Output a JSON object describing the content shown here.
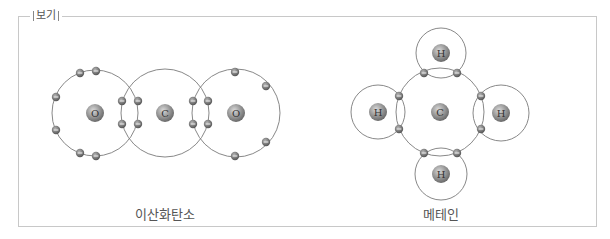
{
  "box": {
    "legend_label": "보기"
  },
  "molecules": [
    {
      "name": "이산화탄소",
      "atoms": [
        {
          "symbol": "O",
          "cx": 95,
          "cy": 113,
          "shell_r": 43
        },
        {
          "symbol": "C",
          "cx": 165,
          "cy": 113,
          "shell_r": 44
        },
        {
          "symbol": "O",
          "cx": 236,
          "cy": 113,
          "shell_r": 44
        }
      ],
      "electrons": [
        [
          80,
          73
        ],
        [
          56,
          97
        ],
        [
          56,
          130
        ],
        [
          80,
          153
        ],
        [
          96,
          156
        ],
        [
          122,
          101
        ],
        [
          122,
          124
        ],
        [
          138,
          101
        ],
        [
          138,
          124
        ],
        [
          193,
          101
        ],
        [
          193,
          124
        ],
        [
          208,
          101
        ],
        [
          208,
          124
        ],
        [
          235,
          72
        ],
        [
          266,
          86
        ],
        [
          266,
          142
        ],
        [
          235,
          156
        ],
        [
          96,
          71
        ]
      ],
      "caption_pos": [
        165,
        213
      ]
    },
    {
      "name": "메테인",
      "atoms": [
        {
          "symbol": "C",
          "cx": 440,
          "cy": 112,
          "shell_r": 44
        },
        {
          "symbol": "H",
          "cx": 441,
          "cy": 53,
          "shell_r": 25
        },
        {
          "symbol": "H",
          "cx": 378,
          "cy": 112,
          "shell_r": 27
        },
        {
          "symbol": "H",
          "cx": 501,
          "cy": 113,
          "shell_r": 28
        },
        {
          "symbol": "H",
          "cx": 441,
          "cy": 174,
          "shell_r": 26
        }
      ],
      "electrons": [
        [
          424,
          73
        ],
        [
          457,
          73
        ],
        [
          399,
          96
        ],
        [
          399,
          129
        ],
        [
          481,
          96
        ],
        [
          481,
          129
        ],
        [
          424,
          153
        ],
        [
          457,
          153
        ]
      ],
      "caption_pos": [
        441,
        213
      ]
    }
  ],
  "colors": {
    "shell_stroke": "#7a7a7a",
    "nucleus_fill": "#8c8c8c",
    "electron_fill": "#6e6e6e",
    "frame": "#c8c8c8",
    "text": "#555555"
  }
}
